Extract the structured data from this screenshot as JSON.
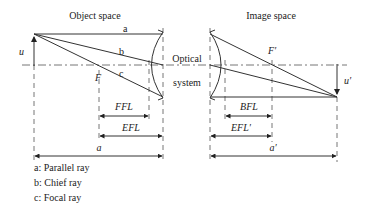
{
  "titles": {
    "object_space": "Object space",
    "image_space": "Image space"
  },
  "system_label": {
    "line1": "Optical",
    "line2": "system"
  },
  "points": {
    "object_height": "u",
    "image_height": "u′",
    "front_focus": "F",
    "back_focus": "F′"
  },
  "ray_labels": {
    "a": "a",
    "b": "b",
    "c": "c"
  },
  "dimensions": {
    "ffl": "FFL",
    "efl": "EFL",
    "object_distance": "a",
    "bfl": "BFL",
    "efl_prime": "EFL′",
    "image_distance": "a′"
  },
  "legend": [
    "a: Parallel ray",
    "b: Chief ray",
    "c: Focal ray"
  ],
  "colors": {
    "line": "#333333",
    "dashed": "#666666"
  }
}
